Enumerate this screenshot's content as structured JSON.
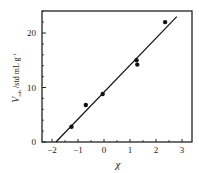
{
  "chart_data": {
    "type": "scatter",
    "title": "",
    "xlabel": "χ",
    "ylabel": "V_ads /std mL g^-1",
    "ylabel_main": "V",
    "ylabel_sub": "ads",
    "ylabel_rest": " /std mL g",
    "ylabel_sup": "-1",
    "xlim": [
      -2.3,
      3.4
    ],
    "ylim": [
      0,
      24
    ],
    "xticks": [
      -2,
      -1,
      0,
      1,
      2,
      3
    ],
    "yticks": [
      0,
      10,
      20
    ],
    "grid": false,
    "legend": null,
    "series": [
      {
        "name": "data",
        "marker": "filled-circle",
        "x": [
          -1.25,
          -0.7,
          -0.05,
          1.25,
          1.28,
          2.35
        ],
        "y": [
          2.8,
          6.8,
          8.8,
          15.0,
          14.2,
          22.0
        ]
      },
      {
        "name": "linear fit",
        "type": "line",
        "x": [
          -1.85,
          2.8
        ],
        "y": [
          0,
          23.0
        ]
      }
    ]
  }
}
